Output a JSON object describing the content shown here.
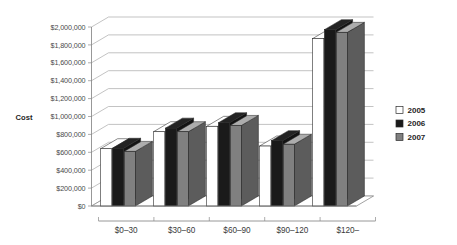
{
  "chart_data": {
    "type": "bar",
    "title": "",
    "subtitle": "",
    "xlabel": "",
    "ylabel": "Cost",
    "categories": [
      "$0–30",
      "$30–60",
      "$60–90",
      "$90–120",
      "$120–"
    ],
    "series": [
      {
        "name": "2005",
        "color": "#ffffff",
        "values": [
          640000,
          830000,
          890000,
          670000,
          1870000
        ]
      },
      {
        "name": "2006",
        "color": "#1a1a1a",
        "values": [
          645000,
          870000,
          930000,
          730000,
          1970000
        ]
      },
      {
        "name": "2007",
        "color": "#808080",
        "values": [
          610000,
          830000,
          900000,
          690000,
          1940000
        ]
      }
    ],
    "ylim": [
      0,
      2000000
    ],
    "ytick_step": 200000,
    "ytick_labels": [
      "$0",
      "$200,000",
      "$400,000",
      "$600,000",
      "$800,000",
      "$1,000,000",
      "$1,200,000",
      "$1,400,000",
      "$1,600,000",
      "$1,800,000",
      "$2,000,000"
    ],
    "grid": true,
    "legend_position": "right",
    "style": "3d-clustered-column"
  },
  "legend": {
    "items": [
      {
        "label": "2005",
        "swatch": "#ffffff"
      },
      {
        "label": "2006",
        "swatch": "#1a1a1a"
      },
      {
        "label": "2007",
        "swatch": "#808080"
      }
    ]
  },
  "axes": {
    "y_title": "Cost"
  },
  "colors": {
    "series_2005": "#ffffff",
    "series_2006": "#1a1a1a",
    "series_2007": "#808080",
    "gridline": "#a9a9a9",
    "axis": "#7d7d7d",
    "text": "#3a3a3a",
    "background": "#ffffff"
  }
}
